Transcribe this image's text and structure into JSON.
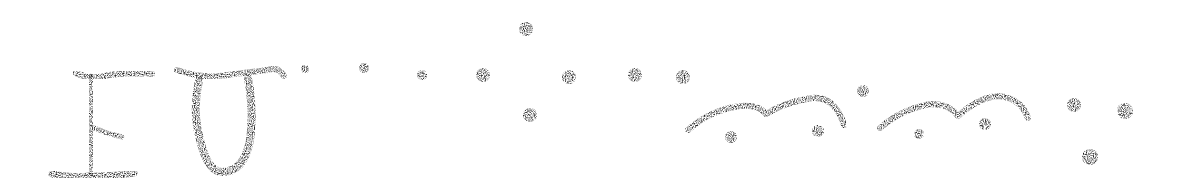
{
  "image": {
    "description": "Stippled handwritten glyph sequence on white background",
    "ink_color": "#1a1a1a",
    "background": "#ffffff"
  },
  "glyphs": [
    {
      "name": "letter-e-glyph",
      "approx_char": "E"
    },
    {
      "name": "letter-u-glyph",
      "approx_char": "U"
    },
    {
      "name": "dot-row",
      "count": 7
    },
    {
      "name": "dot-cluster-middle",
      "count": 2
    },
    {
      "name": "double-arch-glyph-1",
      "dots_below": 2
    },
    {
      "name": "double-arch-glyph-2",
      "dots_below": 2
    },
    {
      "name": "therefore-dot-cluster",
      "count": 3
    }
  ]
}
